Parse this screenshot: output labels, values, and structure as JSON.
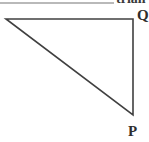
{
  "header": {
    "rule_present": true,
    "clipped_text": "trian"
  },
  "figure": {
    "type": "right-triangle",
    "stroke_color": "#404040",
    "stroke_width": 1.6,
    "background": "#ffffff",
    "vertices": [
      {
        "name": "left-vertex",
        "label": "",
        "x": 6,
        "y": 19
      },
      {
        "name": "top-right-vertex",
        "label": "Q",
        "x": 133,
        "y": 19
      },
      {
        "name": "bottom-right-vertex",
        "label": "P",
        "x": 133,
        "y": 115
      }
    ],
    "edges": [
      {
        "name": "top-edge",
        "from": "left-vertex",
        "to": "top-right-vertex"
      },
      {
        "name": "right-edge",
        "from": "top-right-vertex",
        "to": "bottom-right-vertex"
      },
      {
        "name": "hypotenuse",
        "from": "bottom-right-vertex",
        "to": "left-vertex"
      }
    ]
  },
  "labels": {
    "q": "Q",
    "p": "P"
  }
}
